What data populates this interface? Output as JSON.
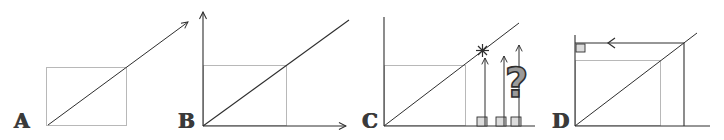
{
  "figure": {
    "colors": {
      "ink": "#2e2e2e",
      "pencil": "#b8b8b8",
      "square_fill": "#dcdcdc",
      "qmark_fill": "#9a9a9a",
      "background": "#ffffff"
    },
    "panels": [
      {
        "label": "A",
        "elements": [
          "diagonal-arrow",
          "light-rectangle"
        ]
      },
      {
        "label": "B",
        "elements": [
          "x-axis-arrow",
          "y-axis-arrow",
          "diagonal-line",
          "light-rectangle"
        ]
      },
      {
        "label": "C",
        "elements": [
          "x-axis",
          "y-axis",
          "diagonal-line",
          "light-rectangle",
          "intersection-star",
          "three-vertical-arrows",
          "three-base-squares",
          "question-mark"
        ],
        "question_mark": "?"
      },
      {
        "label": "D",
        "elements": [
          "x-axis",
          "y-axis",
          "diagonal-line",
          "light-rectangle",
          "projection-line-vertical",
          "projection-line-horizontal-arrow-left",
          "right-angle-marker"
        ]
      }
    ]
  }
}
